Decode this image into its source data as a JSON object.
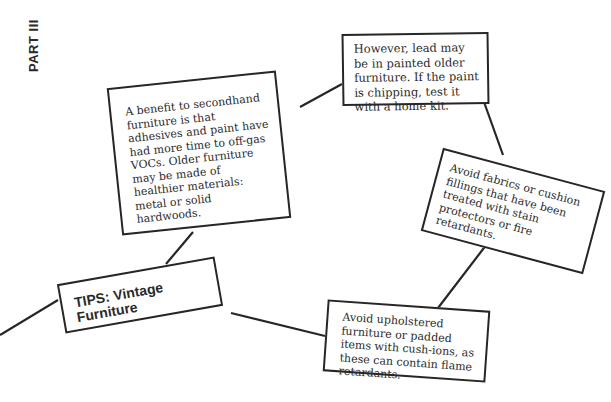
{
  "section_label": "PART III",
  "diagram": {
    "central_node": {
      "label": "TIPS: Vintage Furniture"
    },
    "nodes": [
      {
        "id": "benefit",
        "text": "A benefit to secondhand furniture is that adhesives and paint have had more time to off-gas VOCs. Older furniture may be made of healthier materials: metal or solid hardwoods."
      },
      {
        "id": "lead",
        "text": "However, lead may be in painted older furniture. If the paint is chipping, test it with a home kit."
      },
      {
        "id": "fabrics",
        "text": "Avoid fabrics or cushion fillings that have been treated with stain protectors or fire retardants."
      },
      {
        "id": "upholstered",
        "text": "Avoid upholstered furniture or padded items with cush-ions, as these can contain flame retardants."
      }
    ],
    "colors": {
      "line": "#262626",
      "text": "#2a2a2a",
      "background": "#ffffff"
    }
  }
}
